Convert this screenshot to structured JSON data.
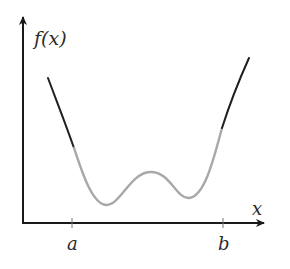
{
  "figure": {
    "type": "function-plot",
    "y_axis_label": "f(x)",
    "x_axis_label": "x",
    "ticks": [
      {
        "label": "a",
        "x": 72
      },
      {
        "label": "b",
        "x": 223
      }
    ],
    "colors": {
      "axis": "#1a1a1a",
      "curve_outside": "#1f1f1f",
      "curve_inside": "#a8a8a8",
      "text": "#2a2a2a",
      "background": "#ffffff"
    }
  }
}
